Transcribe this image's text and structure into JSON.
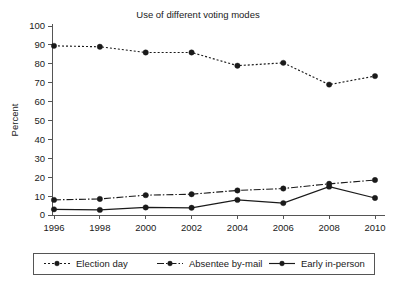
{
  "chart_data": {
    "type": "line",
    "title": "Use of different voting modes",
    "xlabel": "",
    "ylabel": "Percent",
    "categories": [
      "1996",
      "1998",
      "2000",
      "2002",
      "2004",
      "2006",
      "2008",
      "2010"
    ],
    "x": [
      1996,
      1998,
      2000,
      2002,
      2004,
      2006,
      2008,
      2010
    ],
    "xlim": [
      1995,
      2011
    ],
    "ylim": [
      0,
      100
    ],
    "ytick_step": 10,
    "yticks": [
      0,
      10,
      20,
      30,
      40,
      50,
      60,
      70,
      80,
      90,
      100
    ],
    "ytick_labels": [
      "0",
      "10",
      "20",
      "30",
      "40",
      "50",
      "60",
      "70",
      "80",
      "90",
      "100"
    ],
    "grid": false,
    "legend_position": "bottom",
    "series": [
      {
        "name": "Election day",
        "dash": "dotted",
        "dasharray": "2,2",
        "marker": "circle",
        "color": "#1a1a1a",
        "values": [
          89.5,
          89.0,
          86.0,
          86.0,
          79.0,
          80.5,
          69.0,
          73.5
        ]
      },
      {
        "name": "Absentee by-mail",
        "dash": "dash-dot",
        "dasharray": "7,2,1.5,2",
        "marker": "circle",
        "color": "#1a1a1a",
        "values": [
          8.0,
          8.5,
          10.5,
          11.0,
          13.0,
          14.0,
          16.5,
          18.5
        ]
      },
      {
        "name": "Early in-person",
        "dash": "solid",
        "dasharray": "none",
        "marker": "circle",
        "color": "#1a1a1a",
        "values": [
          3.0,
          2.7,
          4.0,
          3.8,
          8.0,
          6.3,
          15.0,
          9.0
        ]
      }
    ]
  },
  "colors": {
    "ink": "#1a1a1a",
    "axis": "#555555",
    "background": "#ffffff"
  }
}
